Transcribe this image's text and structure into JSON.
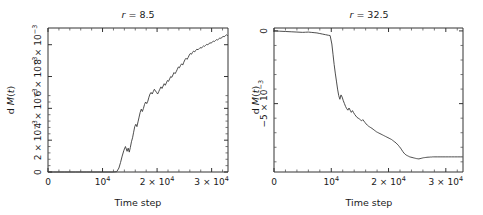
{
  "figure": {
    "background": "#ffffff",
    "line_color": "#3a3a3a",
    "axis_color": "#333333"
  },
  "panels": [
    {
      "id": "left",
      "title_prefix": "r",
      "title_eq": " = ",
      "title_value": "8.5",
      "title_full": "r = 8.5",
      "xlabel": "Time step",
      "ylabel_prefix": "d ",
      "ylabel_var": "M",
      "ylabel_arg": "(t)",
      "ylabel_full": "d M(t)",
      "xticks": [
        "0",
        "10",
        "2 × 10",
        "3 × 10"
      ],
      "xtick_exps": [
        "",
        "4",
        "4",
        "4"
      ],
      "xtick_values": [
        0,
        10000,
        20000,
        30000
      ],
      "yticks": [
        "0",
        "2 × 10",
        "4 × 10",
        "6 × 10",
        "8 × 10"
      ],
      "ytick_exps": [
        "",
        "−3",
        "−3",
        "−3",
        "−3"
      ],
      "ytick_values": [
        0,
        0.002,
        0.004,
        0.006,
        0.008
      ]
    },
    {
      "id": "right",
      "title_prefix": "r",
      "title_eq": " = ",
      "title_value": "32.5",
      "title_full": "r = 32.5",
      "xlabel": "Time step",
      "ylabel_prefix": "d ",
      "ylabel_var": "M",
      "ylabel_arg": "(t)",
      "ylabel_full": "d M(t)",
      "xticks": [
        "0",
        "10",
        "2 × 10",
        "3 × 10"
      ],
      "xtick_exps": [
        "",
        "4",
        "4",
        "4"
      ],
      "xtick_values": [
        0,
        10000,
        20000,
        30000
      ],
      "yticks": [
        "0",
        "−5 × 10"
      ],
      "ytick_exps": [
        "",
        "−3"
      ],
      "ytick_values": [
        0,
        -0.005
      ]
    }
  ],
  "chart_data": [
    {
      "type": "line",
      "title": "r = 8.5",
      "xlabel": "Time step",
      "ylabel": "d M(t)",
      "xlim": [
        0,
        33000
      ],
      "ylim": [
        0,
        0.00905
      ],
      "grid": false,
      "legend": "none",
      "series": [
        {
          "name": "d M(t) for r = 8.5",
          "x": [
            0,
            1000,
            2000,
            3000,
            4000,
            5000,
            6000,
            7000,
            8000,
            9000,
            10000,
            11000,
            12000,
            12600,
            13000,
            13300,
            13600,
            13900,
            14200,
            14500,
            14700,
            14900,
            15100,
            15300,
            15500,
            15700,
            15900,
            16100,
            16300,
            16500,
            16700,
            16900,
            17100,
            17300,
            17500,
            17700,
            17900,
            18100,
            18300,
            18500,
            18700,
            18900,
            19100,
            19300,
            19500,
            19700,
            19900,
            20100,
            20300,
            20500,
            20700,
            20900,
            21100,
            21300,
            21500,
            21700,
            21900,
            22100,
            22300,
            22500,
            22700,
            22900,
            23100,
            23300,
            23500,
            23700,
            23900,
            24100,
            24300,
            24500,
            24700,
            24900,
            25100,
            25300,
            25500,
            25700,
            25900,
            26100,
            26300,
            26500,
            26700,
            26900,
            27100,
            27300,
            27500,
            27700,
            27900,
            28100,
            28300,
            28500,
            28700,
            28900,
            29100,
            29300,
            29500,
            29700,
            29900,
            30100,
            30300,
            30500,
            30700,
            30900,
            31100,
            31300,
            31500,
            31700,
            31900,
            32100,
            32300,
            32500,
            32700,
            32900
          ],
          "y": [
            0,
            0,
            0,
            0,
            0,
            0,
            0,
            0,
            0,
            0,
            0,
            0,
            0,
            2e-05,
            0.00025,
            0.0006,
            0.001,
            0.00135,
            0.0016,
            0.0013,
            0.0015,
            0.00125,
            0.00155,
            0.0019,
            0.00215,
            0.0025,
            0.00285,
            0.003,
            0.00285,
            0.00315,
            0.00345,
            0.00375,
            0.00395,
            0.0038,
            0.004,
            0.00425,
            0.0044,
            0.0043,
            0.00445,
            0.0047,
            0.0049,
            0.005,
            0.0049,
            0.00505,
            0.0052,
            0.0051,
            0.005,
            0.0049,
            0.00505,
            0.0052,
            0.00535,
            0.00525,
            0.0054,
            0.00555,
            0.00545,
            0.0056,
            0.00575,
            0.0057,
            0.00585,
            0.006,
            0.00595,
            0.0061,
            0.00625,
            0.00618,
            0.0063,
            0.00645,
            0.0066,
            0.00655,
            0.0067,
            0.0068,
            0.00672,
            0.0069,
            0.00705,
            0.00715,
            0.00708,
            0.0072,
            0.00735,
            0.00745,
            0.0074,
            0.00752,
            0.0076,
            0.00755,
            0.00765,
            0.00772,
            0.00768,
            0.00775,
            0.00782,
            0.00778,
            0.00786,
            0.00792,
            0.0079,
            0.00796,
            0.00802,
            0.008,
            0.00806,
            0.00812,
            0.0081,
            0.00816,
            0.00822,
            0.0082,
            0.00826,
            0.00832,
            0.0083,
            0.00836,
            0.00842,
            0.0084,
            0.00846,
            0.00852,
            0.0085,
            0.00856,
            0.00862,
            0.00858,
            0.00866,
            0.00872,
            0.0087
          ]
        }
      ]
    },
    {
      "type": "line",
      "title": "r = 32.5",
      "xlabel": "Time step",
      "ylabel": "d M(t)",
      "xlim": [
        0,
        33000
      ],
      "ylim": [
        -0.0097,
        0.0002
      ],
      "grid": false,
      "legend": "none",
      "series": [
        {
          "name": "d M(t) for r = 32.5",
          "x": [
            0,
            1000,
            2000,
            3000,
            4000,
            5000,
            5500,
            6000,
            6500,
            7000,
            7500,
            8000,
            8500,
            9000,
            9500,
            9800,
            10100,
            10300,
            10500,
            10700,
            10900,
            11100,
            11300,
            11500,
            11700,
            11900,
            12100,
            12300,
            12500,
            12700,
            12900,
            13100,
            13300,
            13500,
            13700,
            13900,
            14100,
            14300,
            14500,
            14700,
            14900,
            15100,
            15300,
            15500,
            15700,
            15900,
            16100,
            16300,
            16500,
            16700,
            16900,
            17100,
            17300,
            17500,
            17700,
            17900,
            18100,
            18300,
            18500,
            18700,
            18900,
            19100,
            19300,
            19500,
            19700,
            19900,
            20100,
            20300,
            20500,
            20700,
            20900,
            21100,
            21300,
            21500,
            21700,
            21900,
            22100,
            22300,
            22500,
            22700,
            22900,
            23100,
            23300,
            23500,
            23700,
            23900,
            24100,
            24300,
            24500,
            24700,
            24900,
            25100,
            25300,
            25500,
            25700,
            25900,
            26100,
            26300,
            26500,
            26700,
            26900,
            27100,
            27300,
            27500,
            27700,
            27900,
            28100,
            28500,
            29000,
            29500,
            30000,
            30500,
            31000,
            31500,
            32000,
            32500,
            32900
          ],
          "y": [
            0,
            -2e-05,
            -4e-05,
            -6e-05,
            -8e-05,
            -0.0001,
            -9e-05,
            -8e-05,
            -0.0001,
            -0.00012,
            -0.00014,
            -0.00018,
            -0.00022,
            -0.00026,
            -0.0003,
            -0.00032,
            -0.0009,
            -0.0016,
            -0.0023,
            -0.0029,
            -0.00345,
            -0.004,
            -0.00445,
            -0.0047,
            -0.0044,
            -0.00455,
            -0.0048,
            -0.005,
            -0.0052,
            -0.00535,
            -0.00545,
            -0.0053,
            -0.00545,
            -0.0056,
            -0.00548,
            -0.00562,
            -0.00575,
            -0.00585,
            -0.00595,
            -0.006,
            -0.00605,
            -0.00612,
            -0.00618,
            -0.0061,
            -0.0062,
            -0.0063,
            -0.0064,
            -0.00648,
            -0.00655,
            -0.0066,
            -0.00665,
            -0.0067,
            -0.00676,
            -0.00682,
            -0.00688,
            -0.00694,
            -0.00698,
            -0.00702,
            -0.00706,
            -0.0071,
            -0.00714,
            -0.00718,
            -0.00722,
            -0.00726,
            -0.0073,
            -0.00734,
            -0.00738,
            -0.00742,
            -0.00746,
            -0.00752,
            -0.00758,
            -0.00764,
            -0.0077,
            -0.00778,
            -0.00786,
            -0.00796,
            -0.00806,
            -0.00818,
            -0.0083,
            -0.0084,
            -0.00848,
            -0.00854,
            -0.00858,
            -0.00862,
            -0.00866,
            -0.00868,
            -0.0087,
            -0.00872,
            -0.00874,
            -0.00876,
            -0.00878,
            -0.00879,
            -0.0088,
            -0.00878,
            -0.00876,
            -0.00874,
            -0.00872,
            -0.00871,
            -0.0087,
            -0.00869,
            -0.00868,
            -0.00868,
            -0.00867,
            -0.00867,
            -0.00866,
            -0.00866,
            -0.00866,
            -0.00866,
            -0.00866,
            -0.00866,
            -0.00866,
            -0.00866,
            -0.00866,
            -0.00866,
            -0.00866,
            -0.00866,
            -0.00866
          ]
        }
      ]
    }
  ]
}
